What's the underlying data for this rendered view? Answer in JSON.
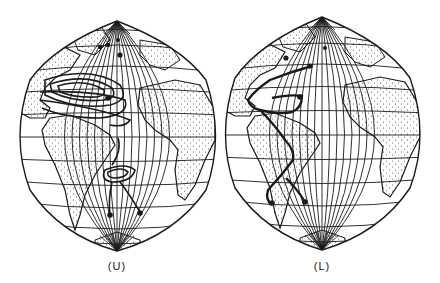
{
  "figure": {
    "panels": [
      {
        "id": "U",
        "label": "(U)",
        "description": "Atlantic map with multiple closed contour loops"
      },
      {
        "id": "L",
        "label": "(L)",
        "description": "Atlantic map with single thick current path"
      }
    ],
    "colors": {
      "ink": "#1a1a1a",
      "background": "#ffffff",
      "stipple": "#444444"
    }
  }
}
